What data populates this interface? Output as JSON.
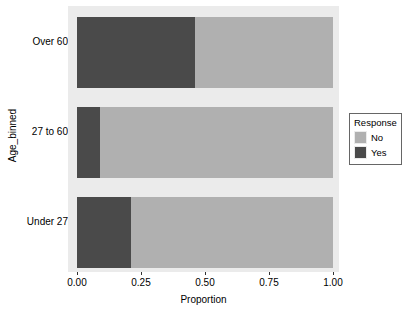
{
  "chart_data": {
    "type": "bar",
    "orientation": "horizontal",
    "stacked": true,
    "normalized": true,
    "title": "",
    "xlabel": "Proportion",
    "ylabel": "Age_binned",
    "categories": [
      "Under 27",
      "27 to 60",
      "Over 60"
    ],
    "categories_top_to_bottom": [
      "Over 60",
      "27 to 60",
      "Under 27"
    ],
    "series": [
      {
        "name": "Yes",
        "color": "#4a4a4a",
        "values": [
          0.21,
          0.09,
          0.46
        ]
      },
      {
        "name": "No",
        "color": "#b0b0b0",
        "values": [
          0.79,
          0.91,
          0.54
        ]
      }
    ],
    "xlim": [
      0.0,
      1.0
    ],
    "xticks": [
      0.0,
      0.25,
      0.5,
      0.75,
      1.0
    ],
    "xtick_labels": [
      "0.00",
      "0.25",
      "0.50",
      "0.75",
      "1.00"
    ],
    "grid": false,
    "legend_position": "right",
    "panel_background": "#ebebeb",
    "plot_background": "#ffffff"
  },
  "axes": {
    "y": {
      "title": "Age_binned",
      "ticks": [
        {
          "label": "Over 60"
        },
        {
          "label": "27 to 60"
        },
        {
          "label": "Under 27"
        }
      ]
    },
    "x": {
      "title": "Proportion",
      "ticks": [
        {
          "label": "0.00"
        },
        {
          "label": "0.25"
        },
        {
          "label": "0.50"
        },
        {
          "label": "0.75"
        },
        {
          "label": "1.00"
        }
      ]
    }
  },
  "legend": {
    "title": "Response",
    "items": [
      {
        "label": "No",
        "color": "#b0b0b0"
      },
      {
        "label": "Yes",
        "color": "#4a4a4a"
      }
    ]
  },
  "bars": [
    {
      "category": "Over 60",
      "segments": [
        {
          "series": "Yes",
          "value": 0.46,
          "color": "#4a4a4a"
        },
        {
          "series": "No",
          "value": 0.54,
          "color": "#b0b0b0"
        }
      ]
    },
    {
      "category": "27 to 60",
      "segments": [
        {
          "series": "Yes",
          "value": 0.09,
          "color": "#4a4a4a"
        },
        {
          "series": "No",
          "value": 0.91,
          "color": "#b0b0b0"
        }
      ]
    },
    {
      "category": "Under 27",
      "segments": [
        {
          "series": "Yes",
          "value": 0.21,
          "color": "#4a4a4a"
        },
        {
          "series": "No",
          "value": 0.79,
          "color": "#b0b0b0"
        }
      ]
    }
  ]
}
